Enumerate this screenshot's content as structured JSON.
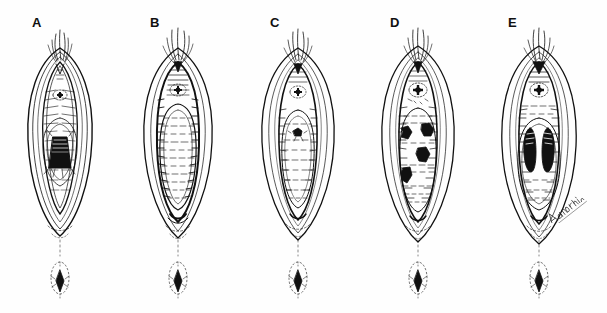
{
  "figure": {
    "type": "medical-line-illustration",
    "title_visible": false,
    "background_color": "#fefefe",
    "ink_color": "#111111",
    "width": 607,
    "height": 313,
    "panel_count": 5,
    "signature_text": "Anderson"
  },
  "panels": [
    {
      "id": "A",
      "label": "A",
      "label_x": 32,
      "label_y": 16,
      "origin_x": 0,
      "description": "Vaginal introitus with single large dark funnel-shaped central lesion",
      "urethral_meatus": true,
      "lesions": [
        {
          "shape": "trapezoid",
          "cx": 60,
          "cy": 152,
          "w": 24,
          "h": 30,
          "fill": "#111111"
        }
      ],
      "anus": true
    },
    {
      "id": "B",
      "label": "B",
      "label_x": 150,
      "label_y": 16,
      "origin_x": 118,
      "description": "Vaginal introitus filled by a smooth bulging pale mass, no discrete lesions",
      "urethral_meatus": true,
      "lesions": [],
      "anus": true
    },
    {
      "id": "C",
      "label": "C",
      "label_x": 270,
      "label_y": 16,
      "origin_x": 238,
      "description": "Vaginal introitus with single small dark punctate central spot",
      "urethral_meatus": true,
      "lesions": [
        {
          "shape": "speck",
          "cx": 59,
          "cy": 132,
          "w": 9,
          "h": 7,
          "fill": "#111111"
        }
      ],
      "anus": true
    },
    {
      "id": "D",
      "label": "D",
      "label_x": 390,
      "label_y": 16,
      "origin_x": 358,
      "description": "Vaginal introitus with four scattered irregular dark lesions",
      "urethral_meatus": true,
      "lesions": [
        {
          "shape": "irregular",
          "cx": 48,
          "cy": 133,
          "w": 13,
          "h": 12,
          "fill": "#111111"
        },
        {
          "shape": "irregular",
          "cx": 70,
          "cy": 130,
          "w": 13,
          "h": 13,
          "fill": "#111111"
        },
        {
          "shape": "irregular",
          "cx": 66,
          "cy": 155,
          "w": 13,
          "h": 13,
          "fill": "#111111"
        },
        {
          "shape": "irregular",
          "cx": 49,
          "cy": 175,
          "w": 11,
          "h": 15,
          "fill": "#111111"
        }
      ],
      "anus": true
    },
    {
      "id": "E",
      "label": "E",
      "label_x": 508,
      "label_y": 16,
      "origin_x": 476,
      "description": "Vaginal introitus with paired vertical elongated dark lesions flanking the midline",
      "urethral_meatus": true,
      "lesions": [
        {
          "shape": "ellipse",
          "cx": 50,
          "cy": 148,
          "w": 15,
          "h": 40,
          "fill": "#111111"
        },
        {
          "shape": "ellipse",
          "cx": 73,
          "cy": 148,
          "w": 15,
          "h": 40,
          "fill": "#111111"
        }
      ],
      "anus": true
    }
  ]
}
